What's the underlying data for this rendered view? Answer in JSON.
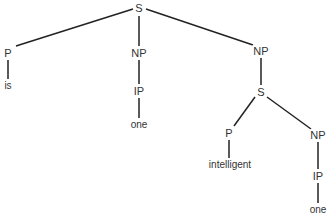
{
  "diagram": {
    "type": "syntax-tree",
    "line_color": "#222222",
    "text_color": "#333333",
    "nodes": [
      {
        "id": "n0",
        "label": "S",
        "x": 139,
        "y": 8
      },
      {
        "id": "n1",
        "label": "P",
        "x": 8,
        "y": 53
      },
      {
        "id": "n2",
        "label": "is",
        "x": 8,
        "y": 86,
        "leaf": true
      },
      {
        "id": "n3",
        "label": "NP",
        "x": 139,
        "y": 53
      },
      {
        "id": "n4",
        "label": "IP",
        "x": 139,
        "y": 91
      },
      {
        "id": "n5",
        "label": "one",
        "x": 139,
        "y": 125,
        "leaf": true
      },
      {
        "id": "n6",
        "label": "NP",
        "x": 261,
        "y": 51
      },
      {
        "id": "n7",
        "label": "S",
        "x": 261,
        "y": 92
      },
      {
        "id": "n8",
        "label": "P",
        "x": 229,
        "y": 133
      },
      {
        "id": "n9",
        "label": "intelligent",
        "x": 230,
        "y": 165,
        "leaf": true
      },
      {
        "id": "n10",
        "label": "NP",
        "x": 318,
        "y": 135
      },
      {
        "id": "n11",
        "label": "IP",
        "x": 318,
        "y": 176
      },
      {
        "id": "n12",
        "label": "one",
        "x": 318,
        "y": 210,
        "leaf": true
      }
    ],
    "edges": [
      {
        "from": [
          133,
          9
        ],
        "to": [
          16,
          46
        ]
      },
      {
        "from": [
          139,
          16
        ],
        "to": [
          139,
          46
        ]
      },
      {
        "from": [
          146,
          9
        ],
        "to": [
          253,
          45
        ]
      },
      {
        "from": [
          8,
          60
        ],
        "to": [
          8,
          79
        ]
      },
      {
        "from": [
          139,
          60
        ],
        "to": [
          139,
          84
        ]
      },
      {
        "from": [
          139,
          98
        ],
        "to": [
          139,
          118
        ]
      },
      {
        "from": [
          261,
          58
        ],
        "to": [
          261,
          85
        ]
      },
      {
        "from": [
          255,
          97
        ],
        "to": [
          234,
          126
        ]
      },
      {
        "from": [
          267,
          97
        ],
        "to": [
          311,
          129
        ]
      },
      {
        "from": [
          229,
          140
        ],
        "to": [
          229,
          158
        ]
      },
      {
        "from": [
          318,
          142
        ],
        "to": [
          318,
          169
        ]
      },
      {
        "from": [
          318,
          183
        ],
        "to": [
          318,
          203
        ]
      }
    ]
  }
}
